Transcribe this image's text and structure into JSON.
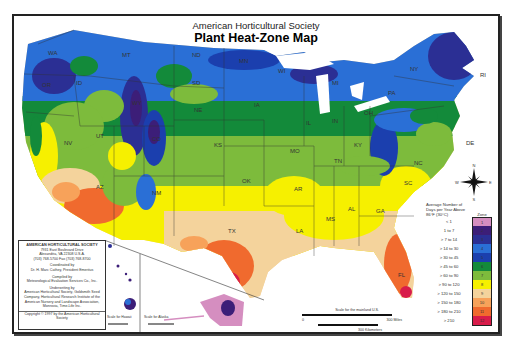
{
  "header": {
    "subtitle": "American Horticultural Society",
    "title": "Plant Heat-Zone Map"
  },
  "state_labels": [
    {
      "id": "WA",
      "x": 34,
      "y": 40
    },
    {
      "id": "OR",
      "x": 28,
      "y": 72
    },
    {
      "id": "ID",
      "x": 62,
      "y": 70
    },
    {
      "id": "MT",
      "x": 108,
      "y": 42
    },
    {
      "id": "WY",
      "x": 118,
      "y": 90
    },
    {
      "id": "NV",
      "x": 50,
      "y": 130
    },
    {
      "id": "UT",
      "x": 82,
      "y": 123
    },
    {
      "id": "CO",
      "x": 138,
      "y": 126
    },
    {
      "id": "AZ",
      "x": 82,
      "y": 174
    },
    {
      "id": "NM",
      "x": 138,
      "y": 180
    },
    {
      "id": "ND",
      "x": 178,
      "y": 42
    },
    {
      "id": "SD",
      "x": 178,
      "y": 70
    },
    {
      "id": "NE",
      "x": 180,
      "y": 97
    },
    {
      "id": "KS",
      "x": 200,
      "y": 132
    },
    {
      "id": "OK",
      "x": 228,
      "y": 168
    },
    {
      "id": "TX",
      "x": 214,
      "y": 218
    },
    {
      "id": "MN",
      "x": 225,
      "y": 48
    },
    {
      "id": "IA",
      "x": 240,
      "y": 92
    },
    {
      "id": "MO",
      "x": 276,
      "y": 138
    },
    {
      "id": "AR",
      "x": 280,
      "y": 176
    },
    {
      "id": "LA",
      "x": 282,
      "y": 218
    },
    {
      "id": "WI",
      "x": 264,
      "y": 58
    },
    {
      "id": "IL",
      "x": 292,
      "y": 110
    },
    {
      "id": "MS",
      "x": 312,
      "y": 206
    },
    {
      "id": "MI",
      "x": 318,
      "y": 70
    },
    {
      "id": "IN",
      "x": 318,
      "y": 108
    },
    {
      "id": "KY",
      "x": 340,
      "y": 132
    },
    {
      "id": "TN",
      "x": 320,
      "y": 148
    },
    {
      "id": "AL",
      "x": 334,
      "y": 196
    },
    {
      "id": "GA",
      "x": 362,
      "y": 198
    },
    {
      "id": "FL",
      "x": 384,
      "y": 262
    },
    {
      "id": "SC",
      "x": 390,
      "y": 170
    },
    {
      "id": "NC",
      "x": 400,
      "y": 150
    },
    {
      "id": "OH",
      "x": 350,
      "y": 100
    },
    {
      "id": "PA",
      "x": 374,
      "y": 80
    },
    {
      "id": "NY",
      "x": 396,
      "y": 56
    },
    {
      "id": "RI",
      "x": 466,
      "y": 62
    },
    {
      "id": "DE",
      "x": 452,
      "y": 130
    }
  ],
  "compass": {
    "n": "N",
    "s": "S",
    "e": "E",
    "w": "W"
  },
  "legend": {
    "heading": "Average Number of Days per Year Above 86°F (30°C)",
    "zone_header": "Zone",
    "zones": [
      {
        "range": "< 1",
        "zone": "1",
        "color": "#d58ec0"
      },
      {
        "range": "1 to 7",
        "zone": "2",
        "color": "#3c1e78"
      },
      {
        "range": "> 7 to 14",
        "zone": "3",
        "color": "#2b2f94"
      },
      {
        "range": "> 14 to 30",
        "zone": "4",
        "color": "#2a6fd6"
      },
      {
        "range": "> 30 to 45",
        "zone": "5",
        "color": "#1b3fae"
      },
      {
        "range": "> 45 to 60",
        "zone": "6",
        "color": "#138a3a"
      },
      {
        "range": "> 60 to 90",
        "zone": "7",
        "color": "#7dbb3c"
      },
      {
        "range": "> 90 to 120",
        "zone": "8",
        "color": "#f6f000"
      },
      {
        "range": "> 120 to 150",
        "zone": "9",
        "color": "#f4d39c"
      },
      {
        "range": "> 150 to 180",
        "zone": "10",
        "color": "#f7a25a"
      },
      {
        "range": "> 180 to 210",
        "zone": "11",
        "color": "#f06a2e"
      },
      {
        "range": "> 210",
        "zone": "12",
        "color": "#d81c4a"
      }
    ]
  },
  "info_box": {
    "org": "AMERICAN HORTICULTURAL SOCIETY",
    "address1": "7931 East Boulevard Drive",
    "address2": "Alexandria, VA 22308 U.S.A.",
    "phone": "(703) 768-5700 Fax (703) 768-8700",
    "coordinated_label": "Coordinated by",
    "coordinator": "Dr. H. Marc Cathey, President Emeritus",
    "compiled_label": "Compiled by",
    "compiler": "Meteorological Evaluation Services Co., Inc.",
    "underwriting_label": "Underwriting by",
    "underwriters": "American Horticultural Society, Goldsmith Seed Company, Horticultural Research Institute of the American Nursery and Landscape Association, Monrovia, Time-Life Inc.",
    "copyright": "Copyright © 1997 by the American Horticultural Society"
  },
  "insets": {
    "hawaii_islands": [
      "Kauai",
      "Oahu",
      "Molokai",
      "Lanai",
      "Maui",
      "Hawaii"
    ],
    "hawaii_scale": "Scale for Hawaii",
    "alaska_scale": "Scale for Alaska",
    "hawaii_miles": "100 Miles",
    "hawaii_km": "100 Kilometers",
    "alaska_miles": "300 Miles",
    "alaska_km": "300 Kilometers"
  },
  "scale": {
    "label": "Scale for the mainland U.S.",
    "miles": "300 Miles",
    "km": "300 Kilometers",
    "zero": "0"
  }
}
